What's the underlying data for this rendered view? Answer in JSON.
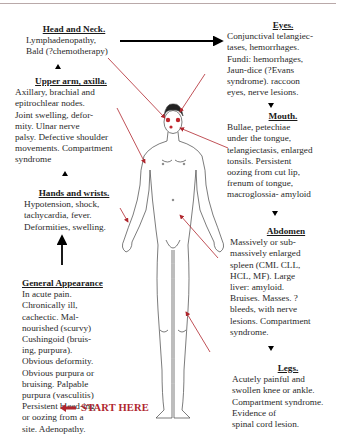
{
  "diagram": {
    "type": "clinical-examination-flow",
    "start_label": "START HERE",
    "colors": {
      "arrow_red": "#b0262d",
      "arrow_black": "#000000",
      "text": "#2a2a2a"
    },
    "sections": {
      "head_neck": {
        "title": "Head and Neck.",
        "body": "Lymphadenopathy, Bald (?chemotherapy)"
      },
      "upper_arm": {
        "title": "Upper arm, axilla.",
        "body": "Axillary, brachial  and epitrochlear nodes. Joint swelling, deformity. Ulnar nerve palsy. Defective shoulder movements. Compartment syndrome"
      },
      "hands_wrists": {
        "title": "Hands and wrists.",
        "body": "Hypotension, shock, tachycardia, fever. Deformities, swelling."
      },
      "general": {
        "title": "General Appearance",
        "body": "In acute pain. Chronically ill, cachectic. Malnourished (scurvy) Cushingoid (bruising, purpura). Obvious deformity. Obvious purpura or bruising. Palpable purpura (vasculitis) Persistent bleed-ing or oozing from a site. Adenopathy."
      },
      "eyes": {
        "title": "Eyes.",
        "body": "Conjunctival telangiectases, hemorrhages. Fundi: hemorrhages, Jaun-dice (?Evans syndrome). raccoon eyes, nerve lesions."
      },
      "mouth": {
        "title": "Mouth.",
        "body": "Bullae, petechiae under the tongue, telangiectasis, enlarged tonsils. Persistent oozing from cut lip, frenum of tongue, macroglossia- amyloid"
      },
      "abdomen": {
        "title": "Abdomen",
        "body": "Massively or submassively enlarged spleen (CML CLL, HCL, MF). Large liver: amyloid. Bruises. Masses. ? bleeds, with nerve lesions. Compartment syndrome."
      },
      "legs": {
        "title": "Legs.",
        "body": "Acutely painful and swollen knee or ankle. Compartment syndrome. Evidence of spinal cord lesion."
      }
    },
    "lines": {
      "head_neck": [
        "Lymphadenopathy,",
        "Bald (?chemotherapy)"
      ],
      "upper_arm": [
        "Axillary, brachial  and",
        "epitrochlear nodes.",
        "Joint swelling, defor-",
        "mity. Ulnar nerve",
        "palsy. Defective shoulder",
        "movements. Compartment",
        "syndrome"
      ],
      "hands_wrists": [
        "Hypotension, shock,",
        "tachycardia, fever.",
        "Deformities, swelling."
      ],
      "general": [
        "In acute pain.",
        "Chronically ill,",
        "cachectic. Mal-",
        "nourished (scurvy)",
        "Cushingoid (bruis-",
        "ing, purpura).",
        "Obvious deformity.",
        "Obvious purpura or",
        "bruising. Palpable",
        "purpura (vasculitis)",
        "Persistent bleed-ing",
        "or oozing from a",
        "site. Adenopathy."
      ],
      "eyes": [
        "Conjunctival telangiec-",
        "tases, hemorrhages.",
        "Fundi: hemorrhages,",
        "Jaun-dice (?Evans",
        "syndrome). raccoon",
        "eyes, nerve lesions."
      ],
      "mouth": [
        "Bullae, petechiae",
        "under the tongue,",
        "telangiectasis, enlarged",
        "tonsils. Persistent",
        "oozing from cut lip,",
        "frenum of tongue,",
        "macroglossia- amyloid"
      ],
      "abdomen": [
        "Massively or sub-",
        "massively enlarged",
        "spleen (CML CLL,",
        "HCL, MF). Large",
        "liver: amyloid.",
        "Bruises. Masses. ?",
        "bleeds, with nerve",
        "lesions. Compartment",
        "syndrome."
      ],
      "legs": [
        "Acutely painful and",
        "swollen knee or ankle.",
        "Compartment syndrome.",
        "Evidence of",
        "spinal cord lesion."
      ]
    }
  }
}
